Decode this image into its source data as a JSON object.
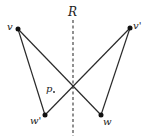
{
  "diagram": {
    "axis_label": "R",
    "region_label": "p",
    "points": {
      "v": {
        "label": "v",
        "x": 18,
        "y": 29
      },
      "v_prime": {
        "label": "v'",
        "x": 130,
        "y": 28
      },
      "w_prime": {
        "label": "w'",
        "x": 45,
        "y": 115
      },
      "w": {
        "label": "w",
        "x": 101,
        "y": 115
      }
    },
    "segments": [
      [
        "v",
        "w_prime"
      ],
      [
        "v",
        "w"
      ],
      [
        "v_prime",
        "w_prime"
      ],
      [
        "v_prime",
        "w"
      ]
    ],
    "colors": {
      "stroke": "#2a2a2a",
      "dashed": "#555555"
    }
  }
}
